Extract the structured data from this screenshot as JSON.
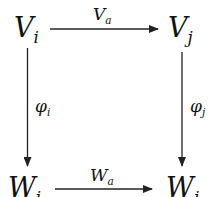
{
  "diagram": {
    "type": "commutative-square",
    "nodes": {
      "top_left": {
        "base": "V",
        "sub": "i"
      },
      "top_right": {
        "base": "V",
        "sub": "j"
      },
      "bottom_left": {
        "base": "W",
        "sub": "i"
      },
      "bottom_right": {
        "base": "W",
        "sub": "j"
      }
    },
    "arrows": {
      "top": {
        "from": "V_i",
        "to": "V_j",
        "label_base": "V",
        "label_sub": "a"
      },
      "bottom": {
        "from": "W_i",
        "to": "W_j",
        "label_base": "W",
        "label_sub": "a"
      },
      "left": {
        "from": "V_i",
        "to": "W_i",
        "label_base": "φ",
        "label_sub": "i"
      },
      "right": {
        "from": "V_j",
        "to": "W_j",
        "label_base": "φ",
        "label_sub": "j"
      }
    },
    "line_color": "#222222"
  }
}
